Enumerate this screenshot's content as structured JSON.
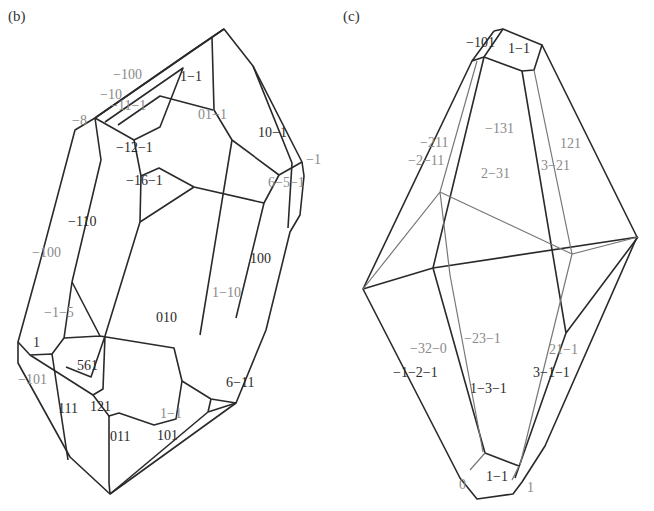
{
  "figure": {
    "panels": [
      {
        "id": "b",
        "label": "(b)",
        "faces": [
          {
            "text": "−100",
            "x": 113,
            "y": 72,
            "tone": "gray"
          },
          {
            "text": "1−1",
            "x": 180,
            "y": 74,
            "tone": "dark"
          },
          {
            "text": "−10",
            "x": 100,
            "y": 92,
            "tone": "gray"
          },
          {
            "text": "−11−1",
            "x": 110,
            "y": 103,
            "tone": "gray"
          },
          {
            "text": "−8",
            "x": 72,
            "y": 118,
            "tone": "gray"
          },
          {
            "text": "01−1",
            "x": 198,
            "y": 112,
            "tone": "gray"
          },
          {
            "text": "10−1",
            "x": 258,
            "y": 130,
            "tone": "dark"
          },
          {
            "text": "−12−1",
            "x": 116,
            "y": 145,
            "tone": "dark"
          },
          {
            "text": "−1",
            "x": 306,
            "y": 157,
            "tone": "gray"
          },
          {
            "text": "−16−1",
            "x": 126,
            "y": 178,
            "tone": "dark"
          },
          {
            "text": "6−5−1",
            "x": 268,
            "y": 180,
            "tone": "gray"
          },
          {
            "text": "−110",
            "x": 68,
            "y": 219,
            "tone": "dark"
          },
          {
            "text": "−100",
            "x": 32,
            "y": 250,
            "tone": "gray"
          },
          {
            "text": "100",
            "x": 250,
            "y": 256,
            "tone": "dark"
          },
          {
            "text": "1−10",
            "x": 212,
            "y": 290,
            "tone": "gray"
          },
          {
            "text": "−1−5",
            "x": 44,
            "y": 310,
            "tone": "gray"
          },
          {
            "text": "010",
            "x": 156,
            "y": 315,
            "tone": "dark"
          },
          {
            "text": "1",
            "x": 33,
            "y": 340,
            "tone": "dark"
          },
          {
            "text": "561",
            "x": 77,
            "y": 363,
            "tone": "dark"
          },
          {
            "text": "−101",
            "x": 18,
            "y": 377,
            "tone": "gray"
          },
          {
            "text": "6−11",
            "x": 226,
            "y": 380,
            "tone": "dark"
          },
          {
            "text": "111",
            "x": 58,
            "y": 406,
            "tone": "dark"
          },
          {
            "text": "121",
            "x": 90,
            "y": 404,
            "tone": "dark"
          },
          {
            "text": "1−1",
            "x": 160,
            "y": 411,
            "tone": "gray"
          },
          {
            "text": "011",
            "x": 110,
            "y": 434,
            "tone": "dark"
          },
          {
            "text": "101",
            "x": 157,
            "y": 433,
            "tone": "dark"
          }
        ]
      },
      {
        "id": "c",
        "label": "(c)",
        "faces": [
          {
            "text": "−101",
            "x": 466,
            "y": 40,
            "tone": "dark"
          },
          {
            "text": "1−1",
            "x": 508,
            "y": 46,
            "tone": "dark"
          },
          {
            "text": "−131",
            "x": 485,
            "y": 126,
            "tone": "gray"
          },
          {
            "text": "121",
            "x": 560,
            "y": 141,
            "tone": "gray"
          },
          {
            "text": "−211",
            "x": 420,
            "y": 140,
            "tone": "gray"
          },
          {
            "text": "−2−11",
            "x": 408,
            "y": 158,
            "tone": "gray"
          },
          {
            "text": "3−21",
            "x": 541,
            "y": 163,
            "tone": "gray"
          },
          {
            "text": "2−31",
            "x": 481,
            "y": 171,
            "tone": "gray"
          },
          {
            "text": "−23−1",
            "x": 464,
            "y": 336,
            "tone": "gray"
          },
          {
            "text": "−32−0",
            "x": 410,
            "y": 346,
            "tone": "gray"
          },
          {
            "text": "21−1",
            "x": 549,
            "y": 347,
            "tone": "gray"
          },
          {
            "text": "−1−2−1",
            "x": 393,
            "y": 370,
            "tone": "dark"
          },
          {
            "text": "3−1−1",
            "x": 533,
            "y": 370,
            "tone": "dark"
          },
          {
            "text": "1−3−1",
            "x": 470,
            "y": 386,
            "tone": "dark"
          },
          {
            "text": "0",
            "x": 459,
            "y": 482,
            "tone": "gray"
          },
          {
            "text": "1−1",
            "x": 486,
            "y": 474,
            "tone": "dark"
          },
          {
            "text": "1",
            "x": 527,
            "y": 485,
            "tone": "gray"
          }
        ]
      }
    ]
  }
}
